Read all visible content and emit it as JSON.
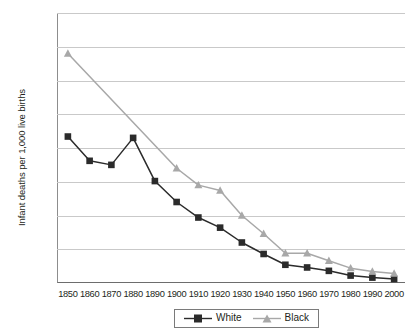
{
  "chart_data": {
    "type": "line",
    "title": "",
    "subtitle": "",
    "xlabel": "",
    "ylabel": "Infant deaths per 1,000 live births",
    "categories": [
      "1850",
      "1860",
      "1870",
      "1880",
      "1890",
      "1900",
      "1910",
      "1920",
      "1930",
      "1940",
      "1950",
      "1960",
      "1970",
      "1980",
      "1990",
      "2000"
    ],
    "x": [
      1850,
      1860,
      1870,
      1880,
      1890,
      1900,
      1910,
      1920,
      1930,
      1940,
      1950,
      1960,
      1970,
      1980,
      1990,
      2000
    ],
    "xlim": [
      1845,
      2005
    ],
    "ylim": [
      0,
      400
    ],
    "y_ticks": [
      0,
      50,
      100,
      150,
      200,
      250,
      300,
      350,
      400
    ],
    "x_ticks": [
      1850,
      1860,
      1870,
      1880,
      1890,
      1900,
      1910,
      1920,
      1930,
      1940,
      1950,
      1960,
      1970,
      1980,
      1990,
      2000
    ],
    "grid": true,
    "grid_axis": "y",
    "legend_position": "bottom",
    "series": [
      {
        "name": "White",
        "color": "#2b2b2b",
        "marker": "square",
        "x": [
          1850,
          1860,
          1870,
          1880,
          1890,
          1900,
          1910,
          1920,
          1930,
          1940,
          1950,
          1960,
          1970,
          1980,
          1990,
          2000
        ],
        "values": [
          217,
          181,
          175,
          215,
          151,
          120,
          97,
          82,
          60,
          43,
          27,
          23,
          18,
          11,
          8,
          6
        ]
      },
      {
        "name": "Black",
        "color": "#a8a8a8",
        "marker": "triangle",
        "x": [
          1850,
          1900,
          1910,
          1920,
          1930,
          1940,
          1950,
          1960,
          1970,
          1980,
          1990,
          2000
        ],
        "values": [
          340,
          170,
          145,
          137,
          100,
          73,
          44,
          44,
          33,
          22,
          17,
          14
        ]
      }
    ],
    "annotations": []
  },
  "legend": {
    "items": [
      {
        "label": "White"
      },
      {
        "label": "Black"
      }
    ]
  }
}
